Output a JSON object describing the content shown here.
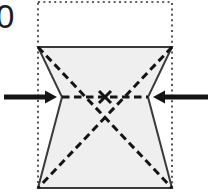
{
  "figure": {
    "label": "0",
    "canvas": {
      "width": 208,
      "height": 195,
      "background": "#ffffff"
    }
  },
  "colors": {
    "shape_fill": "#efefef",
    "shape_stroke": "#3a3a3a",
    "dashed_stroke": "#141414",
    "dotted_stroke": "#2b2b2b",
    "arrow_color": "#141414",
    "label_color": "#1c1c1c"
  },
  "chart_data": {
    "type": "diagram",
    "title": "",
    "reference_rectangle": {
      "name": "undeformed-outline",
      "style": "dotted",
      "x_left": 38,
      "x_right": 172,
      "y_top": 2,
      "y_bottom": 188,
      "width": 134,
      "height": 186
    },
    "deformed_shape": {
      "name": "hourglass-element",
      "style": "solid-outline-filled",
      "description": "concave hourglass quadrilateral, pinched at mid-height",
      "points": [
        [
          38,
          47
        ],
        [
          172,
          47
        ],
        [
          148,
          97
        ],
        [
          172,
          188
        ],
        [
          38,
          188
        ],
        [
          62,
          97
        ]
      ],
      "top_edge_y": 47,
      "bottom_edge_y": 188,
      "waist_y": 97,
      "waist_left_x": 62,
      "waist_right_x": 148
    },
    "dashed_lines": [
      {
        "name": "diagonal-top-left-to-bottom-right",
        "from": [
          38,
          47
        ],
        "to": [
          172,
          188
        ]
      },
      {
        "name": "diagonal-top-right-to-bottom-left",
        "from": [
          172,
          47
        ],
        "to": [
          38,
          188
        ]
      },
      {
        "name": "waist-horizontal",
        "from": [
          62,
          97
        ],
        "to": [
          148,
          97
        ]
      }
    ],
    "center_marker": {
      "name": "center-cross",
      "x": 105,
      "y": 97
    },
    "arrows": [
      {
        "name": "left-compression-arrow",
        "direction": "right",
        "tail": [
          4,
          97
        ],
        "tip": [
          57,
          97
        ],
        "shaft_thickness": 5,
        "head_width": 13,
        "head_length": 12
      },
      {
        "name": "right-compression-arrow",
        "direction": "left",
        "tail": [
          208,
          97
        ],
        "tip": [
          153,
          97
        ],
        "shaft_thickness": 5,
        "head_width": 13,
        "head_length": 12
      }
    ]
  }
}
